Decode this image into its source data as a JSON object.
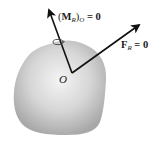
{
  "diagram": {
    "body": {
      "shape": "irregular-blob",
      "fill_center": "#f2f2f2",
      "fill_edge": "#a9a9a9"
    },
    "origin": {
      "label": "O",
      "x": 72,
      "y": 73
    },
    "vectors": [
      {
        "id": "moment",
        "symbol": "M",
        "subscript": "R",
        "outer_subscript": "O",
        "equals": "= 0",
        "from": [
          72,
          73
        ],
        "to": [
          49,
          9
        ],
        "has_curl": true,
        "color": "#111111"
      },
      {
        "id": "force",
        "symbol": "F",
        "subscript": "R",
        "equals": "= 0",
        "from": [
          72,
          73
        ],
        "to": [
          139,
          25
        ],
        "color": "#111111"
      }
    ],
    "labels": {
      "moment_open": "(",
      "moment_symbol": "M",
      "moment_sub": "R",
      "moment_close": ")",
      "moment_outer_sub": "O",
      "moment_eq": " = 0",
      "force_symbol": "F",
      "force_sub": "R",
      "force_eq": " = 0",
      "origin": "O"
    }
  }
}
